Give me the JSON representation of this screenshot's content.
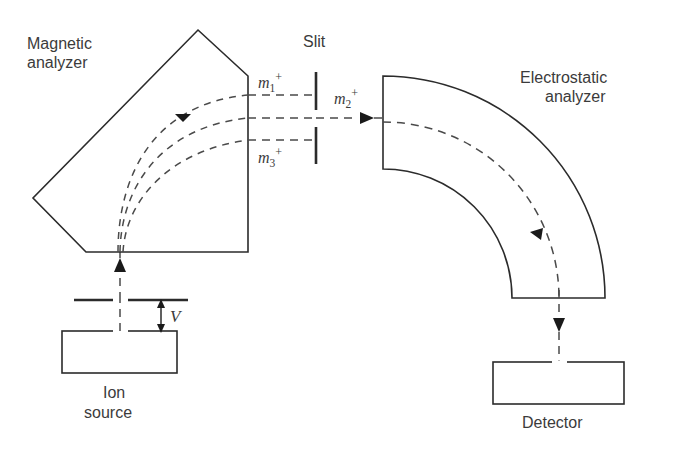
{
  "figure": {
    "background_color": "#ffffff",
    "line_color": "#2b2b2b",
    "beam_color": "#4a4a4a",
    "text_color": "#3b3b3b"
  },
  "labels": {
    "magnetic_analyzer_line1": "Magnetic",
    "magnetic_analyzer_line2": "analyzer",
    "slit": "Slit",
    "electrostatic_analyzer_line1": "Electrostatic",
    "electrostatic_analyzer_line2": "analyzer",
    "ion_source_line1": "Ion",
    "ion_source_line2": "source",
    "detector": "Detector",
    "voltage": "V"
  },
  "ion_beams": [
    {
      "id": "m1",
      "symbol": "m",
      "subscript": "1",
      "superscript": "+",
      "position": "upper"
    },
    {
      "id": "m2",
      "symbol": "m",
      "subscript": "2",
      "superscript": "+",
      "position": "center"
    },
    {
      "id": "m3",
      "symbol": "m",
      "subscript": "3",
      "superscript": "+",
      "position": "lower"
    }
  ],
  "components": [
    {
      "name": "ion-source",
      "shape": "rectangle"
    },
    {
      "name": "accelerating-plate",
      "shape": "split-bar"
    },
    {
      "name": "magnetic-analyzer",
      "shape": "pentagon"
    },
    {
      "name": "slit",
      "shape": "two-bars"
    },
    {
      "name": "electrostatic-analyzer",
      "shape": "quarter-annulus"
    },
    {
      "name": "detector",
      "shape": "rectangle"
    }
  ],
  "icons": {
    "beam_arrow": "triangle-arrowhead",
    "dimension_arrow": "double-headed-arrow"
  }
}
